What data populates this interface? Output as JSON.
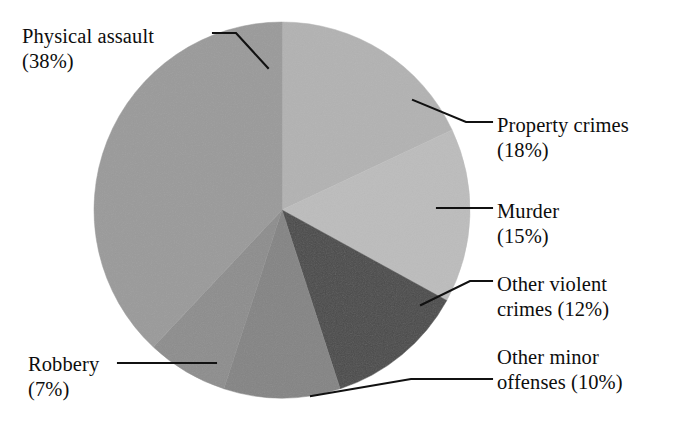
{
  "chart_data": {
    "type": "pie",
    "title": "",
    "subtitle": "",
    "xlabel": "",
    "ylabel": "",
    "legend_position": "callout-labels",
    "grid": false,
    "units": "percent",
    "start_angle_deg": 0,
    "direction": "clockwise",
    "center": {
      "x": 282,
      "y": 210
    },
    "radius": 188,
    "categories": [
      "Property crimes",
      "Murder",
      "Other violent crimes",
      "Other minor offenses",
      "Robbery",
      "Physical assault"
    ],
    "values": [
      18,
      15,
      12,
      10,
      7,
      38
    ],
    "slices": [
      {
        "label": "Property crimes",
        "value": 18,
        "value_text": "(18%)",
        "color": "#b2b2b2"
      },
      {
        "label": "Murder",
        "value": 15,
        "value_text": "(15%)",
        "color": "#bcbcbc"
      },
      {
        "label": "Other violent crimes",
        "value": 12,
        "value_text": "(12%)",
        "color": "#4a4a4a"
      },
      {
        "label": "Other minor offenses",
        "value": 10,
        "value_text": "(10%)",
        "color": "#848484"
      },
      {
        "label": "Robbery",
        "value": 7,
        "value_text": "(7%)",
        "color": "#8d8d8d"
      },
      {
        "label": "Physical assault",
        "value": 38,
        "value_text": "(38%)",
        "color": "#9a9a9a"
      }
    ]
  },
  "labels": {
    "physical_assault": "Physical assault\n(38%)",
    "property_crimes": "Property crimes\n(18%)",
    "murder": "Murder\n(15%)",
    "other_violent_crimes": "Other violent\ncrimes (12%)",
    "other_minor_offenses": "Other minor\noffenses (10%)",
    "robbery": "Robbery\n(7%)"
  },
  "colors": {
    "background": "#ffffff",
    "leader_line": "#111111",
    "text": "#0d0d0d"
  }
}
